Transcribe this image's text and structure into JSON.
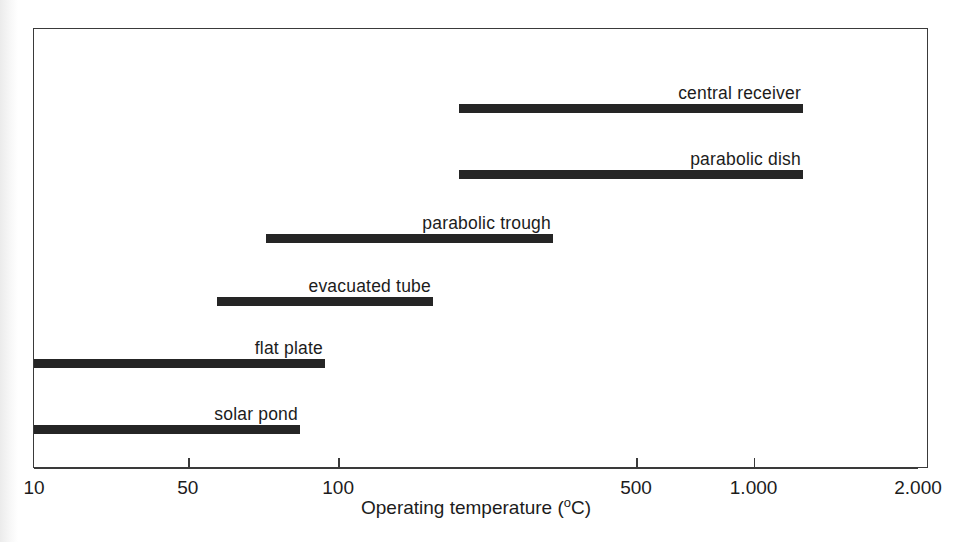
{
  "chart_data": {
    "type": "bar",
    "title": "",
    "subtitle": "",
    "orientation": "horizontal",
    "style": "range-bar",
    "xlabel": "Operating temperature ( °C)",
    "xlabel_text": "Operating temperature (",
    "xlabel_unit_sup": "o",
    "xlabel_unit": "C)",
    "ylabel": "",
    "xscale": "log",
    "xlim": [
      10,
      2000
    ],
    "grid": false,
    "legend": "none",
    "label_placement": "above-bar-right-aligned",
    "axis_tick_values": [
      10,
      50,
      100,
      500,
      1000,
      2000
    ],
    "axis_tick_labels": [
      "10",
      "50",
      "100",
      "500",
      "1.000",
      "2.000"
    ],
    "axis_tick_fracs": [
      0.0,
      0.174,
      0.344,
      0.681,
      0.814,
      1.0
    ],
    "categories": [
      "central receiver",
      "parabolic dish",
      "parabolic trough",
      "evacuated tube",
      "flat plate",
      "solar pond"
    ],
    "bars": [
      {
        "label": "central receiver",
        "start": 200,
        "end": 1300,
        "start_frac": 0.4808,
        "end_frac": 0.8699
      },
      {
        "label": "parabolic dish",
        "start": 200,
        "end": 1300,
        "start_frac": 0.4808,
        "end_frac": 0.8699
      },
      {
        "label": "parabolic trough",
        "start": 75,
        "end": 300,
        "start_frac": 0.2624,
        "end_frac": 0.5871
      },
      {
        "label": "evacuated tube",
        "start": 60,
        "end": 180,
        "start_frac": 0.2071,
        "end_frac": 0.4513
      },
      {
        "label": "flat plate",
        "start": 10,
        "end": 90,
        "start_frac": 0.0,
        "end_frac": 0.3291
      },
      {
        "label": "solar pond",
        "start": 10,
        "end": 75,
        "start_frac": 0.0,
        "end_frac": 0.3009
      }
    ],
    "values": [
      1300,
      1300,
      300,
      180,
      90,
      75
    ],
    "colors": {
      "bar": "#252525",
      "axis": "#3a3a3a",
      "frame": "#3a3a3a",
      "text": "#1c1c1c",
      "background": "#ffffff"
    }
  }
}
